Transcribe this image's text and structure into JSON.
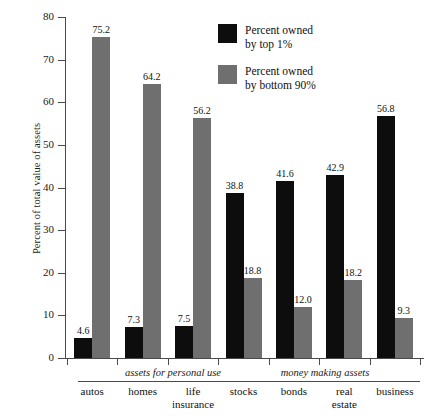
{
  "chart_data": {
    "type": "bar",
    "title": "",
    "xlabel": "",
    "ylabel": "Percent of total value of assets",
    "ylim": [
      0,
      80
    ],
    "yticks": [
      0,
      10,
      20,
      30,
      40,
      50,
      60,
      70,
      80
    ],
    "grid": false,
    "legend_position": "top-right",
    "categories": [
      "autos",
      "homes",
      "life insurance",
      "stocks",
      "bonds",
      "real estate",
      "business"
    ],
    "groups": [
      {
        "name": "assets for personal use",
        "categories": [
          "autos",
          "homes",
          "life insurance"
        ]
      },
      {
        "name": "money making assets",
        "categories": [
          "stocks",
          "bonds",
          "real estate",
          "business"
        ]
      }
    ],
    "series": [
      {
        "name": "Percent owned by top 1%",
        "color": "#0d0d0d",
        "values": [
          4.6,
          7.3,
          7.5,
          38.8,
          41.6,
          42.9,
          56.8
        ]
      },
      {
        "name": "Percent owned by bottom 90%",
        "color": "#6f6f6f",
        "values": [
          75.2,
          64.2,
          56.2,
          18.8,
          12.0,
          18.2,
          9.3
        ]
      }
    ]
  },
  "axis": {
    "y_title": "Percent of total value of assets",
    "y_tick_labels": [
      "0",
      "10",
      "20",
      "30",
      "40",
      "50",
      "60",
      "70",
      "80"
    ]
  },
  "legend": {
    "items": [
      {
        "label": "Percent owned\nby top 1%",
        "color": "#0d0d0d",
        "swatch_name": "legend-swatch-top-1-percent"
      },
      {
        "label": "Percent owned\nby bottom 90%",
        "color": "#6f6f6f",
        "swatch_name": "legend-swatch-bottom-90-percent"
      }
    ]
  },
  "groups": [
    {
      "label": "assets for personal use"
    },
    {
      "label": "money making assets"
    }
  ],
  "categories": [
    {
      "label": "autos"
    },
    {
      "label": "homes"
    },
    {
      "label": "life\ninsurance"
    },
    {
      "label": "stocks"
    },
    {
      "label": "bonds"
    },
    {
      "label": "real\nestate"
    },
    {
      "label": "business"
    }
  ],
  "values": {
    "top1": [
      "4.6",
      "7.3",
      "7.5",
      "38.8",
      "41.6",
      "42.9",
      "56.8"
    ],
    "bottom90": [
      "75.2",
      "64.2",
      "56.2",
      "18.8",
      "12.0",
      "18.2",
      "9.3"
    ]
  }
}
